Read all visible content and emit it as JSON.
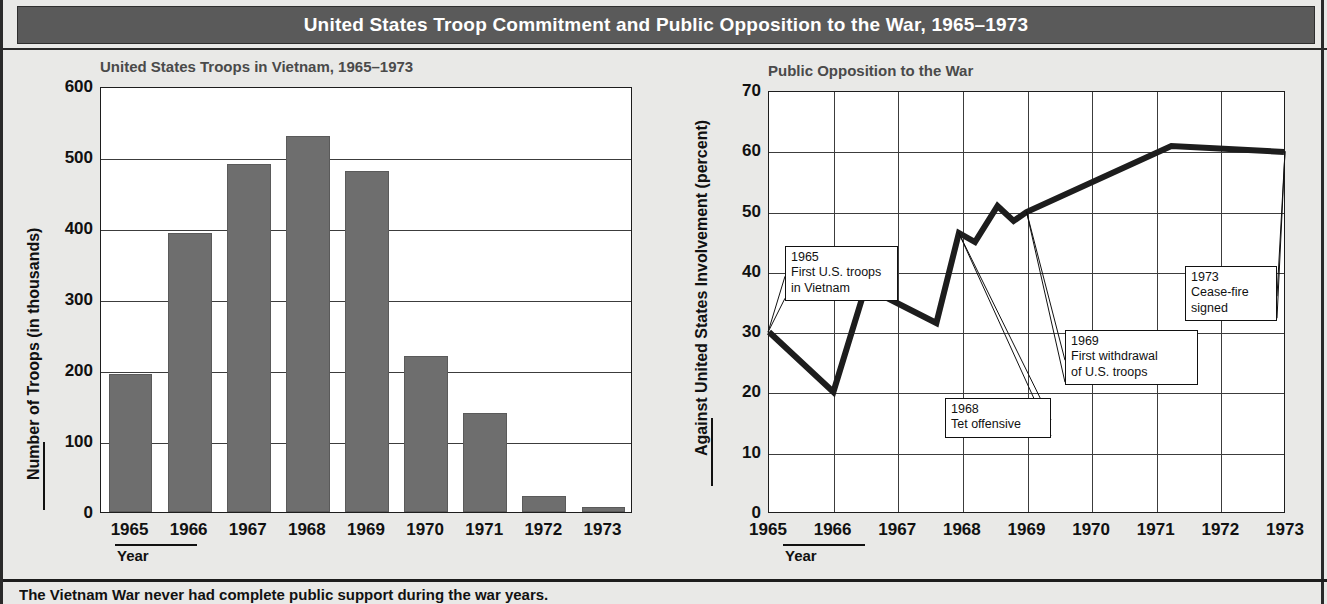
{
  "header": {
    "title": "United States Troop Commitment and Public Opposition to the War, 1965–1973"
  },
  "caption": {
    "text": "The Vietnam War never had complete public support during the war years."
  },
  "chart_data": [
    {
      "type": "bar",
      "title": "United States Troops in Vietnam, 1965–1973",
      "xlabel": "Year",
      "ylabel": "Number of Troops (in thousands)",
      "categories": [
        "1965",
        "1966",
        "1967",
        "1968",
        "1969",
        "1970",
        "1971",
        "1972",
        "1973"
      ],
      "values": [
        195,
        393,
        490,
        530,
        480,
        220,
        140,
        22,
        7
      ],
      "ylim": [
        0,
        600
      ],
      "yticks": [
        0,
        100,
        200,
        300,
        400,
        500,
        600
      ],
      "grid": true,
      "bar_color": "#6e6e6e"
    },
    {
      "type": "line",
      "title": "Public Opposition to the War",
      "xlabel": "Year",
      "ylabel": "Against United States Involvement (percent)",
      "xticks": [
        "1965",
        "1966",
        "1967",
        "1968",
        "1969",
        "1970",
        "1971",
        "1972",
        "1973"
      ],
      "ylim": [
        0,
        70
      ],
      "yticks": [
        0,
        10,
        20,
        30,
        40,
        50,
        60,
        70
      ],
      "grid": true,
      "line_color": "#1d1d1d",
      "x": [
        1965.0,
        1966.0,
        1966.5,
        1967.6,
        1967.95,
        1968.2,
        1968.55,
        1968.8,
        1969.0,
        1971.25,
        1973.0
      ],
      "y": [
        30,
        20,
        37.5,
        31.5,
        46.5,
        45,
        51,
        48.5,
        50,
        61,
        60
      ],
      "annotations": [
        {
          "id": "1965",
          "lines": [
            "1965",
            "First U.S. troops",
            "in Vietnam"
          ],
          "target_year": 1965,
          "target_value": 30
        },
        {
          "id": "1968",
          "lines": [
            "1968",
            "Tet offensive"
          ],
          "target_year": 1967.95,
          "target_value": 46.5
        },
        {
          "id": "1969",
          "lines": [
            "1969",
            "First withdrawal",
            "of U.S. troops"
          ],
          "target_year": 1969,
          "target_value": 50
        },
        {
          "id": "1973",
          "lines": [
            "1973",
            "Cease-fire",
            "signed"
          ],
          "target_year": 1973,
          "target_value": 60
        }
      ]
    }
  ]
}
